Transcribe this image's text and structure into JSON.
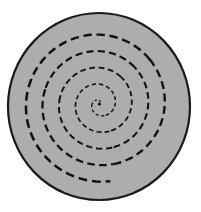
{
  "figure": {
    "type": "vector-illustration",
    "canvas": {
      "width": 201,
      "height": 212,
      "background_color": "#ffffff"
    },
    "disc": {
      "name": "gray-disc",
      "shape": "ellipse",
      "center_x": 99,
      "center_y": 106.5,
      "radius_x": 91,
      "radius_y": 93.5,
      "fill_color": "#adadad",
      "stroke_color": "#1a1a1a",
      "stroke_width": 2.2
    },
    "spiral": {
      "name": "dashed-archimedean-spiral",
      "shape": "archimedean-spiral",
      "center_x": 99.5,
      "center_y": 104,
      "turns": 4.6,
      "start_radius": 2,
      "end_radius": 78,
      "growth_per_turn": 17,
      "start_angle_deg": 0,
      "rotation_deg": -62,
      "stroke_color": "#111111",
      "stroke_width_inner": 1.1,
      "stroke_width_outer": 2.6,
      "dash_pattern_inner": "2,2",
      "dash_pattern_outer": "9,5",
      "direction": "counterclockwise-outward"
    },
    "center_dot": {
      "name": "spiral-center-dot",
      "cx": 99.5,
      "cy": 104,
      "r": 1.6,
      "fill_color": "#111111"
    }
  }
}
